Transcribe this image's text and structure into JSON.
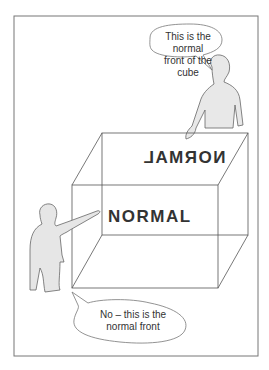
{
  "illustration": {
    "cube_labels": {
      "front": "NORMAL",
      "back_mirrored": "NORMAL"
    },
    "speech_bubbles": {
      "top_right": "This is the normal front of the cube",
      "top_right_line1": "This is the normal",
      "top_right_line2": "front of the cube",
      "bottom_left_line1": "No – this is the",
      "bottom_left_line2": "normal front"
    },
    "colors": {
      "line": "#555555",
      "figure_fill": "#e6e6e6",
      "frame": "#777777"
    }
  }
}
